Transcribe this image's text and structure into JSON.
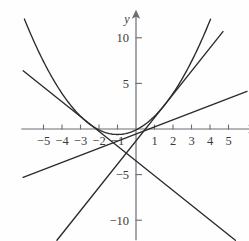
{
  "chart_data": {
    "type": "line",
    "title": "",
    "xlabel": "x",
    "ylabel": "y",
    "xlim": [
      -6.2,
      6.1
    ],
    "ylim": [
      -12.2,
      12.3
    ],
    "grid": false,
    "legend": "none",
    "xticks": [
      -5,
      -4,
      -3,
      -2,
      -1,
      1,
      2,
      3,
      4,
      5
    ],
    "xtick_labels": [
      "-5",
      "-4",
      "-3",
      "-2",
      "-1",
      "1",
      "2",
      "3",
      "4",
      "5"
    ],
    "yticks": [
      10,
      5,
      -5,
      -10
    ],
    "ytick_labels": [
      "10",
      "5",
      "-5",
      "-10"
    ],
    "series": [
      {
        "name": "parabola",
        "kind": "quadratic",
        "equation": "y = 0.5*(x+1)^2 - 0.6",
        "a": 0.5,
        "h": -1.0,
        "k": -0.6,
        "x_start": -6.1,
        "x_end": 4.85,
        "color": "#2b2b2b"
      },
      {
        "name": "steep-rising-line",
        "kind": "linear",
        "equation": "y = 2.55x - 1.3",
        "slope": 2.55,
        "intercept": -1.3,
        "x_start": -5.1,
        "x_end": 4.7,
        "color": "#2b2b2b"
      },
      {
        "name": "shallow-rising-line",
        "kind": "linear",
        "equation": "y = 0.78x - 0.55",
        "slope": 0.78,
        "intercept": -0.55,
        "x_start": -6.1,
        "x_end": 6.0,
        "color": "#2b2b2b"
      },
      {
        "name": "falling-line",
        "kind": "linear",
        "equation": "y = -1.62x - 3.5",
        "slope": -1.62,
        "intercept": -3.5,
        "x_start": -6.1,
        "x_end": 5.5,
        "color": "#2b2b2b"
      }
    ],
    "axis_color": "#6b6b74",
    "curve_color": "#2b2b2b"
  },
  "figure": {
    "x_axis_name": "horizontal-axis",
    "y_axis_name": "vertical-axis"
  }
}
